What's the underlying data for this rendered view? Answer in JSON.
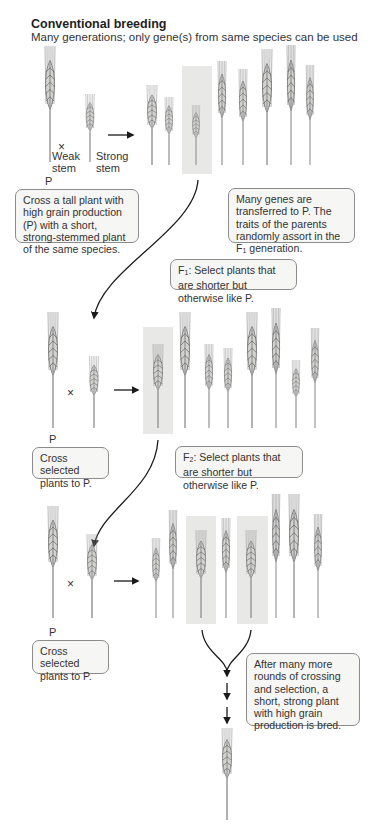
{
  "header": {
    "title": "Conventional breeding",
    "subtitle": "Many generations; only gene(s) from same species can be used"
  },
  "row1": {
    "parent_weak_label_1": "Weak",
    "parent_weak_label_2": "stem",
    "parent_strong_label_1": "Strong",
    "parent_strong_label_2": "stem",
    "cross_symbol": "×",
    "parent_marker": "P"
  },
  "boxes": {
    "cross_tall_plant": "Cross a tall plant with high grain production (P) with a short, strong-stemmed plant of the same species.",
    "genes_transferred_pre": "Many genes are transferred to P. The traits of the parents randomly assort in the F",
    "genes_transferred_sub": "1",
    "genes_transferred_post": " generation.",
    "f1_select_pre": "F",
    "f1_select_sub": "1",
    "f1_select_post": ": Select plants that are shorter but otherwise like P.",
    "cross_selected_1": "Cross selected plants to P.",
    "f2_select_pre": "F",
    "f2_select_sub": "2",
    "f2_select_post": ": Select plants that are shorter but otherwise like P.",
    "cross_selected_2": "Cross selected plants to P.",
    "final_bred": "After many more rounds of crossing and selection, a short, strong plant with high grain production is bred."
  },
  "row2": {
    "cross_symbol": "×",
    "parent_marker": "P"
  },
  "row3": {
    "cross_symbol": "×",
    "parent_marker": "P"
  },
  "colors": {
    "highlight": "#e8e8e6",
    "box_border": "#8c8c8c",
    "box_fill": "#f6f6f4",
    "plant_stroke": "#7a7a7a",
    "arrow": "#1a1a1a"
  }
}
